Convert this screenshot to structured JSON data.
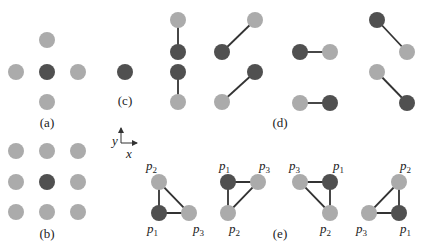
{
  "colors": {
    "dark": "#505050",
    "light": "#ababab",
    "edge": "#333333",
    "background": "#ffffff"
  },
  "panels": {
    "a": {
      "label": "(a)",
      "description": "center dark node with 4 light neighbors (von Neumann)"
    },
    "b": {
      "label": "(b)",
      "description": "center dark node with 8 light neighbors (Moore 3x3)"
    },
    "c": {
      "label": "(c)",
      "description": "single dark node and pairs (vertical and diagonal)"
    },
    "d": {
      "label": "(d)",
      "description": "horizontal and anti-diagonal pairs"
    },
    "e": {
      "label": "(e)",
      "description": "four triangle configurations p1,p2,p3"
    }
  },
  "axes": {
    "x_label": "x",
    "y_label": "y"
  },
  "point_labels": {
    "p": "p",
    "s1": "1",
    "s2": "2",
    "s3": "3"
  }
}
